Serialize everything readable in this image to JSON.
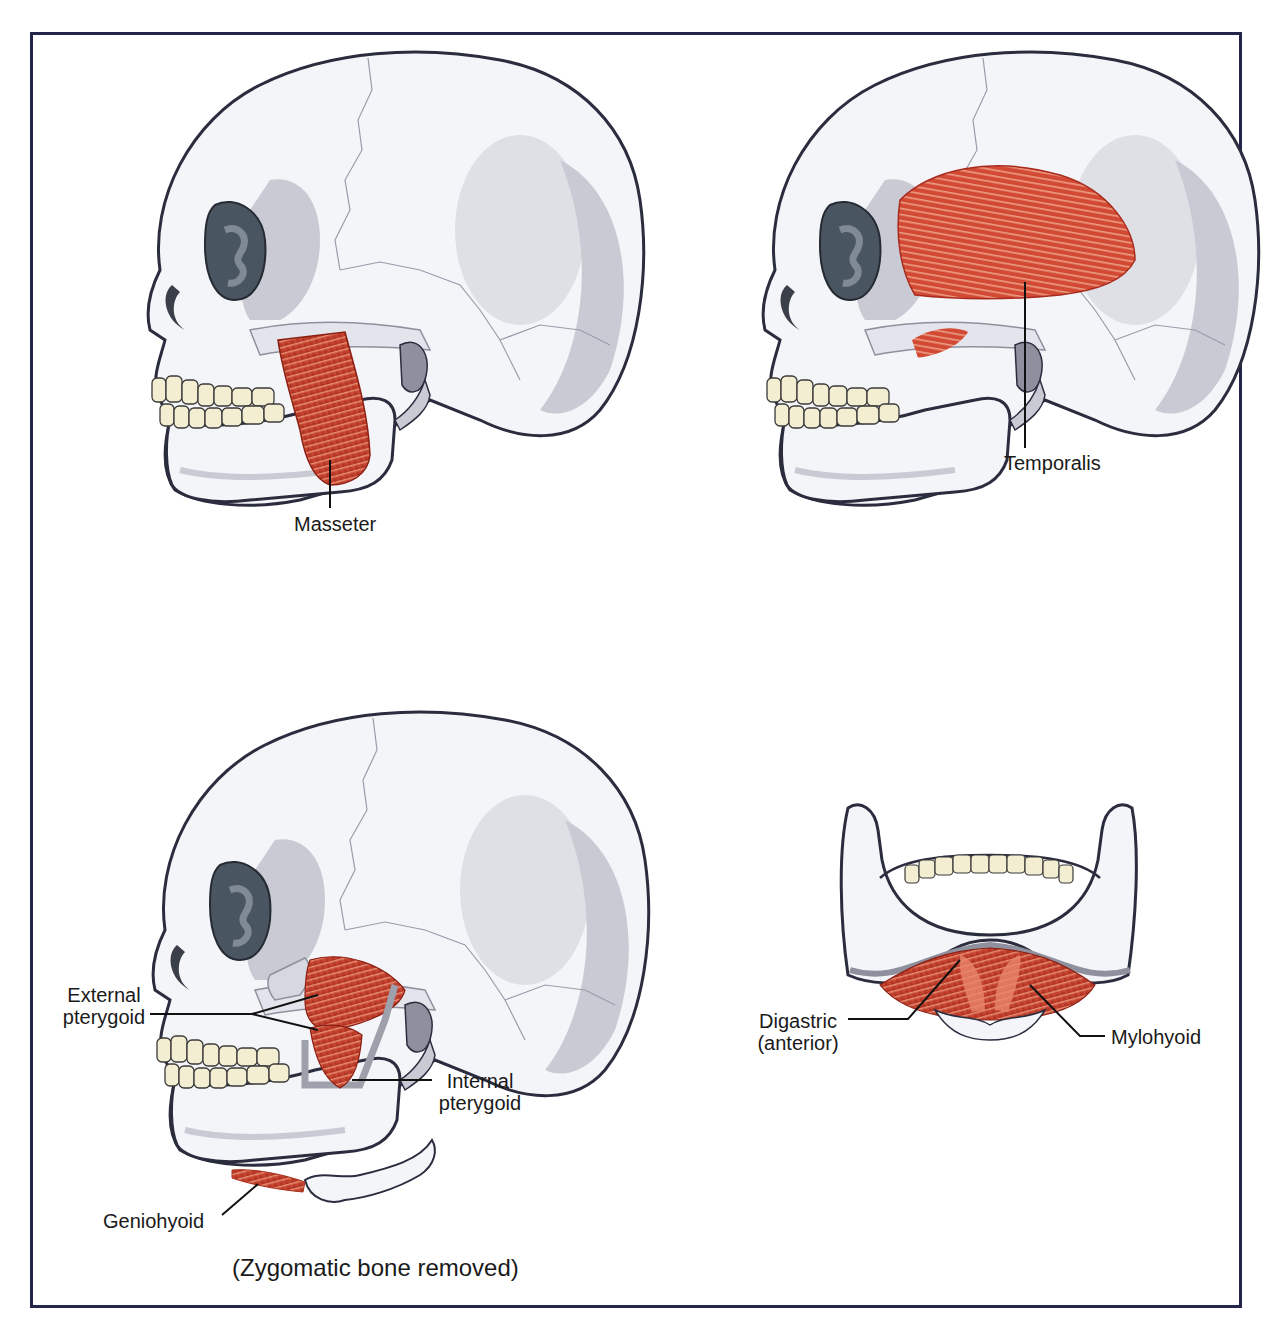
{
  "figure": {
    "panels": [
      {
        "id": "lateral-masseter",
        "labels": [
          {
            "text": "Masseter"
          }
        ]
      },
      {
        "id": "lateral-temporalis",
        "labels": [
          {
            "text": "Temporalis"
          }
        ]
      },
      {
        "id": "lateral-pterygoids",
        "labels": [
          {
            "line1": "External",
            "line2": "pterygoid"
          },
          {
            "line1": "Internal",
            "line2": "pterygoid"
          },
          {
            "text": "Geniohyoid"
          }
        ],
        "caption": "(Zygomatic bone removed)"
      },
      {
        "id": "mandible-inferior",
        "labels": [
          {
            "line1": "Digastric",
            "line2": "(anterior)"
          },
          {
            "text": "Mylohyoid"
          }
        ]
      }
    ]
  },
  "colors": {
    "frame": "#23264a",
    "bone": "#f4f5f8",
    "bone_shadow": "#c9cad3",
    "bone_dark": "#8e909e",
    "outline": "#2b2d3f",
    "orbit": "#4a5562",
    "muscle": "#c8402c",
    "muscle_light": "#e8866a",
    "teeth": "#f3eed2"
  }
}
